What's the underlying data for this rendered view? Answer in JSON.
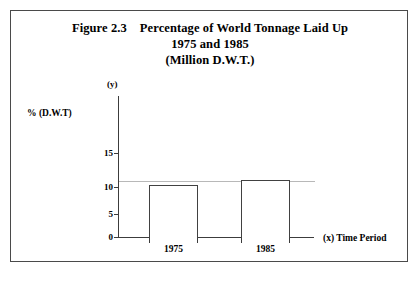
{
  "figure": {
    "title_line_1_number": "Figure 2.3",
    "title_line_1_text": "Percentage of World Tonnage Laid Up",
    "title_line_2": "1975 and 1985",
    "title_line_3": "(Million D.W.T.)"
  },
  "axes": {
    "y_marker": "(y)",
    "y_axis_title": "% (D.W.T)",
    "x_axis_title": "(x) Time Period",
    "y_ticks": [
      "15",
      "10",
      "5",
      "0"
    ],
    "x_categories": [
      "1975",
      "1985"
    ]
  },
  "chart_data": {
    "type": "bar",
    "categories": [
      "1975",
      "1985"
    ],
    "values": [
      9.4,
      10.3
    ],
    "xlabel": "(x) Time Period",
    "ylabel": "% (D.W.T)",
    "ylim": [
      0,
      17
    ],
    "yticks": [
      0,
      5,
      10,
      15
    ],
    "grid": true,
    "gridlines_at": [
      10
    ],
    "legend": "none",
    "bar_style": {
      "fill": "#ffffff",
      "edge": "#414141"
    }
  }
}
